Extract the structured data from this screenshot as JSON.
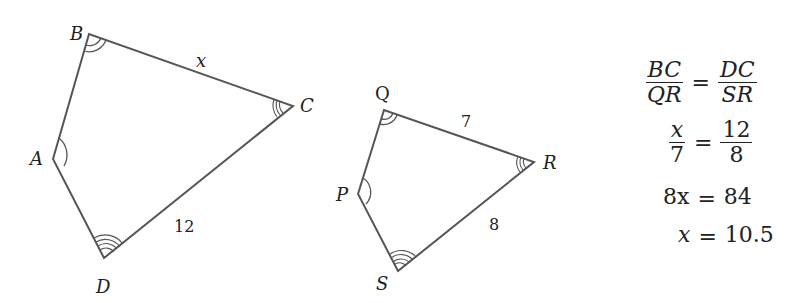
{
  "figure1": {
    "vertices": {
      "A": "A",
      "B": "B",
      "C": "C",
      "D": "D"
    },
    "side_labels": {
      "BC": "x",
      "DC": "12"
    }
  },
  "figure2": {
    "vertices": {
      "P": "P",
      "Q": "Q",
      "R": "R",
      "S": "S"
    },
    "side_labels": {
      "QR": "7",
      "SR": "8"
    }
  },
  "equations": {
    "line1": {
      "left_num": "BC",
      "left_den": "QR",
      "eq": "=",
      "right_num": "DC",
      "right_den": "SR"
    },
    "line2": {
      "left_num": "x",
      "left_den": "7",
      "eq": "=",
      "right_num": "12",
      "right_den": "8"
    },
    "line3": {
      "left": "8x",
      "eq": "=",
      "right": "84"
    },
    "line4": {
      "left": "x",
      "eq": "=",
      "right": "10.5"
    }
  },
  "colors": {
    "stroke": "#555555",
    "text": "#222222"
  }
}
